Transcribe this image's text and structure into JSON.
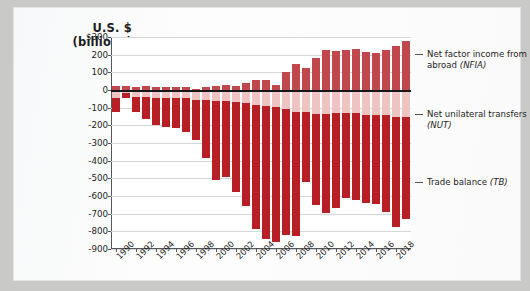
{
  "axis_title": {
    "line1": "U.S. $",
    "line2": "(billions)"
  },
  "colors": {
    "nfia": "#c0474b",
    "nut": "#edc4c2",
    "tb": "#b81f25",
    "axis": "#55565a",
    "zero_line": "#17171a",
    "gridline": "#d6d7d9",
    "page_background": "#fbfbfb",
    "frame": "#c9c9c7"
  },
  "legend": [
    {
      "label": "Net factor income from abroad",
      "abbr": "(NFIA)",
      "color": "#c0474b"
    },
    {
      "label": "Net unilateral transfers",
      "abbr": "(NUT)",
      "color": "#edc4c2"
    },
    {
      "label": "Trade balance",
      "abbr": "(TB)",
      "color": "#b81f25"
    }
  ],
  "chart_data": {
    "type": "bar",
    "title": "",
    "subtitle": "",
    "xlabel": "",
    "ylabel": "U.S. $ (billions)",
    "ylim": [
      -900,
      300
    ],
    "ytick_labels": [
      "$300",
      "200",
      "100",
      "0",
      "-100",
      "-200",
      "-300",
      "-400",
      "-500",
      "-600",
      "-700",
      "-800",
      "-900"
    ],
    "ytick_values": [
      300,
      200,
      100,
      0,
      -100,
      -200,
      -300,
      -400,
      -500,
      -600,
      -700,
      -800,
      -900
    ],
    "xtick_labels": [
      "1990",
      "1992",
      "1994",
      "1996",
      "1998",
      "2000",
      "2002",
      "2004",
      "2006",
      "2008",
      "2010",
      "2012",
      "2014",
      "2016",
      "2018"
    ],
    "grid": true,
    "legend_position": "right",
    "stacked": true,
    "categories": [
      "1990",
      "1991",
      "1992",
      "1993",
      "1994",
      "1995",
      "1996",
      "1997",
      "1998",
      "1999",
      "2000",
      "2001",
      "2002",
      "2003",
      "2004",
      "2005",
      "2006",
      "2007",
      "2008",
      "2009",
      "2010",
      "2011",
      "2012",
      "2013",
      "2014",
      "2015",
      "2016",
      "2017",
      "2018",
      "2019"
    ],
    "series": [
      {
        "name": "Net factor income from abroad (NFIA)",
        "abbr": "NFIA",
        "color": "#c0474b",
        "values": [
          25,
          22,
          18,
          20,
          15,
          18,
          18,
          15,
          5,
          15,
          20,
          30,
          25,
          40,
          55,
          55,
          30,
          100,
          145,
          125,
          180,
          225,
          220,
          225,
          230,
          215,
          210,
          225,
          250,
          280
        ]
      },
      {
        "name": "Net unilateral transfers (NUT)",
        "abbr": "NUT",
        "color": "#edc4c2",
        "values": [
          -45,
          -15,
          -40,
          -42,
          -45,
          -45,
          -45,
          -45,
          -55,
          -55,
          -60,
          -65,
          -70,
          -75,
          -85,
          -90,
          -95,
          -110,
          -125,
          -125,
          -135,
          -135,
          -130,
          -130,
          -130,
          -140,
          -140,
          -140,
          -150,
          -155
        ]
      },
      {
        "name": "Trade balance (TB)",
        "abbr": "TB",
        "color": "#b81f25",
        "values": [
          -80,
          -30,
          -85,
          -120,
          -155,
          -165,
          -170,
          -195,
          -230,
          -330,
          -450,
          -425,
          -505,
          -580,
          -700,
          -755,
          -765,
          -710,
          -700,
          -395,
          -515,
          -560,
          -540,
          -480,
          -495,
          -500,
          -505,
          -550,
          -625,
          -575
        ]
      }
    ],
    "net_balance": [
      -100,
      -23,
      -107,
      -142,
      -185,
      -192,
      -197,
      -225,
      -280,
      -370,
      -490,
      -460,
      -550,
      -615,
      -730,
      -790,
      -830,
      -720,
      -680,
      -395,
      -470,
      -470,
      -450,
      -385,
      -395,
      -425,
      -435,
      -465,
      -525,
      -450
    ]
  }
}
